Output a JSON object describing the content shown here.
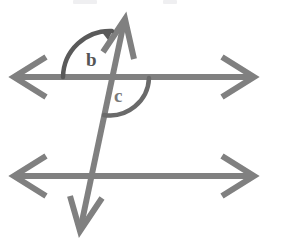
{
  "figure": {
    "background_color": "#ffffff",
    "stroke_color": "#808080",
    "stroke_color_light": "#8d8d8d",
    "label_color": "#555555",
    "arc_color": "#5a5a5a",
    "stroke_width": 6,
    "arc_stroke_width": 4,
    "width": 281,
    "height": 240
  },
  "lines": {
    "top_parallel": {
      "name": "top parallel line",
      "y": 77,
      "x_start": 16,
      "x_end": 252,
      "arrow_left": true,
      "arrow_right": true
    },
    "bottom_parallel": {
      "name": "bottom parallel line",
      "y": 176,
      "x_start": 16,
      "x_end": 252,
      "arrow_left": true,
      "arrow_right": true
    },
    "transversal": {
      "name": "transversal line",
      "x_top": 124,
      "y_top": 24,
      "x_bottom": 81,
      "y_bottom": 227,
      "arrow_top": true,
      "arrow_bottom": true
    }
  },
  "intersections": {
    "upper": {
      "x": 110,
      "y": 77
    },
    "lower": {
      "x": 93,
      "y": 176
    }
  },
  "angles": [
    {
      "id": "b",
      "label": "b",
      "label_x": 86,
      "label_y": 49,
      "position": "above top line, left of transversal",
      "arc_radius": 47,
      "arc_start_deg": 180,
      "arc_end_deg": 282,
      "arrow_at_end": true
    },
    {
      "id": "c",
      "label": "c",
      "label_x": 114,
      "label_y": 85,
      "position": "below top line, right of transversal",
      "arc_radius": 38,
      "arc_start_deg": 0,
      "arc_end_deg": 102,
      "arrow_at_end": false
    }
  ],
  "top_edge_fragments": [
    {
      "left": 73,
      "width": 24
    },
    {
      "left": 163,
      "width": 14
    }
  ]
}
